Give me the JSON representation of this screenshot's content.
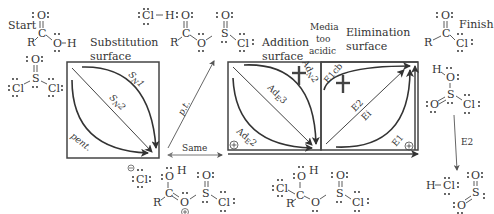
{
  "labels": {
    "start": "Start",
    "finish": "Finish",
    "substitution_surface_line1": "Substitution",
    "substitution_surface_line2": "surface",
    "addition_surface_line1": "Addition",
    "addition_surface_line2": "surface",
    "elimination_surface_line1": "Elimination",
    "elimination_surface_line2": "surface",
    "media_line1": "Media",
    "media_line2": "too",
    "media_line3": "acidic",
    "pt": "p.t.",
    "same": "Same",
    "e2_vertical": "E2"
  },
  "substitution_paths": {
    "sn1": "SN1",
    "sn2": "SN2",
    "pent": "pent."
  },
  "addition_paths": {
    "adn2": "AdN2",
    "ade3": "AdE3",
    "ade2": "AdE2"
  },
  "elimination_paths": {
    "e1cb": "E1cb",
    "e2": "E2",
    "ei": "Ei",
    "e1": "E1"
  },
  "molecules": {
    "carboxylic_acid": "R-C(=O)-OH",
    "thionyl_chloride": "SOCl2",
    "hcl_top": "Cl-H",
    "chlorosulfite_ester": "R-C(=O)-O-S(=O)-Cl",
    "chloride_anion": "Cl-",
    "protonated_intermediate": "R-C(OH)=O+-S(=O)-Cl",
    "tetrahedral_intermediate": "R-C(Cl)(OH)-O-S(=O)-Cl",
    "acyl_chloride": "R-C(=O)-Cl",
    "chlorosulfurous_acid": "HO-S(=O)-Cl",
    "hcl_bottom": "H-Cl",
    "sulfur_dioxide": "SO2"
  },
  "colors": {
    "ink": "#333333",
    "box": "#444444",
    "arrow": "#333333",
    "forbidden_cross": "#444444"
  }
}
